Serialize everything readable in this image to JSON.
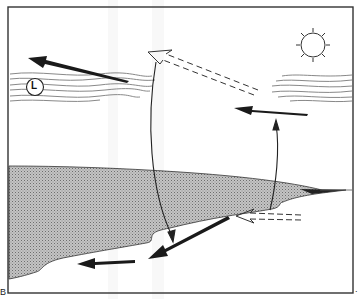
{
  "diagram": {
    "type": "sea-breeze circulation illustration",
    "frame": {
      "x": 8,
      "y": 7,
      "width": 345,
      "height": 286,
      "stroke": "#333333"
    },
    "colors": {
      "ink": "#1a1a1a",
      "cloud_lines": "#777777",
      "land_fill": "#bdbdbd",
      "land_hatch": "#8a8a8a",
      "background": "#ffffff"
    },
    "labels": {
      "low_pressure_marker": "L",
      "corner_left": "B",
      "corner_right": "."
    },
    "elements": {
      "sun": {
        "cx": 313,
        "cy": 45,
        "r": 12,
        "rays": 8
      },
      "cloud_left": {
        "x": 10,
        "y": 73,
        "width": 145,
        "height": 30,
        "has_L_marker": true
      },
      "cloud_right": {
        "x": 270,
        "y": 75,
        "width": 82,
        "height": 28
      },
      "arrows": [
        {
          "name": "upper-left-wind-arrow",
          "style": "solid",
          "from": [
            128,
            81
          ],
          "to": [
            28,
            58
          ]
        },
        {
          "name": "upper-return-flow-arrow",
          "style": "dashed",
          "from": [
            258,
            91
          ],
          "to": [
            148,
            52
          ]
        },
        {
          "name": "mid-right-wind-arrow",
          "style": "solid",
          "from": [
            307,
            113
          ],
          "to": [
            234,
            108
          ]
        },
        {
          "name": "rising-curve-arrow",
          "style": "thin",
          "from": [
            270,
            210
          ],
          "to": [
            276,
            122
          ]
        },
        {
          "name": "sinking-curve-arrow",
          "style": "thin",
          "from": [
            156,
            60
          ],
          "to": [
            172,
            240
          ]
        },
        {
          "name": "surface-dashed-arrow",
          "style": "dashed",
          "from": [
            300,
            218
          ],
          "to": [
            236,
            214
          ]
        },
        {
          "name": "diagonal-surface-arrow",
          "style": "solid",
          "from": [
            228,
            218
          ],
          "to": [
            148,
            258
          ]
        },
        {
          "name": "lower-left-wind-arrow",
          "style": "solid",
          "from": [
            134,
            261
          ],
          "to": [
            78,
            265
          ]
        }
      ]
    }
  }
}
